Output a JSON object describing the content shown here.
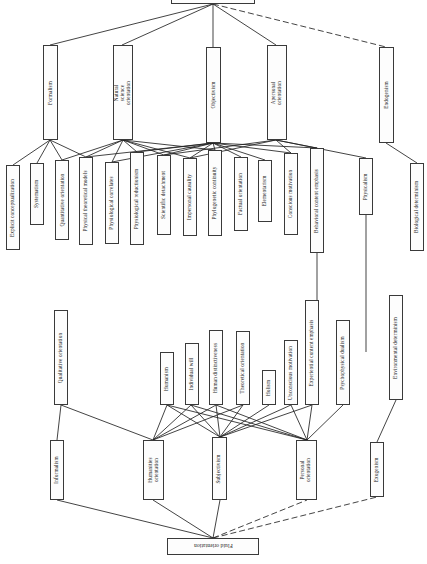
{
  "diagram": {
    "title_top": "Rigid orientation",
    "title_bottom": "Fluid orientation",
    "orientation": "rotated-90",
    "edge_styles": {
      "solid": "#222222",
      "dashed": "#222222"
    }
  },
  "roots": [
    {
      "id": "root_top",
      "label": "Rigid orientation"
    },
    {
      "id": "root_bottom",
      "label": "Fluid orientation"
    }
  ],
  "level1_top": [
    {
      "id": "formalism",
      "label": "Formalism"
    },
    {
      "id": "natsci",
      "label": "Natural science orientation"
    },
    {
      "id": "objectivism",
      "label": "Objectivism"
    },
    {
      "id": "apersonal",
      "label": "Apersonal orientation"
    },
    {
      "id": "endogenism",
      "label": "Endogenism"
    }
  ],
  "level2_top": [
    {
      "id": "explicit",
      "label": "Explicit conceptualization"
    },
    {
      "id": "systematism",
      "label": "Systematism"
    },
    {
      "id": "quantitative",
      "label": "Quantitative orientation"
    },
    {
      "id": "phystheory",
      "label": "Physical theoretical models"
    },
    {
      "id": "physiocorr",
      "label": "Physiological correlates"
    },
    {
      "id": "physioreduct",
      "label": "Physiological reductionism"
    },
    {
      "id": "scidetach",
      "label": "Scientific detachment"
    },
    {
      "id": "impersonal",
      "label": "Impersonal causality"
    },
    {
      "id": "phylogenetic",
      "label": "Phylogenetic continuity"
    },
    {
      "id": "factual",
      "label": "Factual orientation"
    },
    {
      "id": "elementarism",
      "label": "Elementarism"
    },
    {
      "id": "conscious",
      "label": "Conscious motivation"
    },
    {
      "id": "behavioral",
      "label": "Behavioral content emphasis"
    },
    {
      "id": "physicalism",
      "label": "Physicalism"
    },
    {
      "id": "biodeterm",
      "label": "Biological determinism"
    }
  ],
  "level1_bottom": [
    {
      "id": "informalism",
      "label": "Informalism"
    },
    {
      "id": "humanities",
      "label": "Humanities orientation"
    },
    {
      "id": "subjectivism",
      "label": "Subjectivism"
    },
    {
      "id": "personal",
      "label": "Personal orientation"
    },
    {
      "id": "exogenism",
      "label": "Exogenism"
    }
  ],
  "level2_bottom": [
    {
      "id": "qualitative",
      "label": "Qualitative orientation"
    },
    {
      "id": "humanism",
      "label": "Humanism"
    },
    {
      "id": "indwill",
      "label": "Individual will"
    },
    {
      "id": "humdistinct",
      "label": "Human distinctiveness"
    },
    {
      "id": "theoretical",
      "label": "Theoretical orientation"
    },
    {
      "id": "holism",
      "label": "Holism"
    },
    {
      "id": "unconscious",
      "label": "Unconscious motivation"
    },
    {
      "id": "experiential",
      "label": "Experiential content emphasis"
    },
    {
      "id": "psychodual",
      "label": "Psychophysical dualism"
    },
    {
      "id": "envdeterm",
      "label": "Environmental determinism"
    }
  ]
}
